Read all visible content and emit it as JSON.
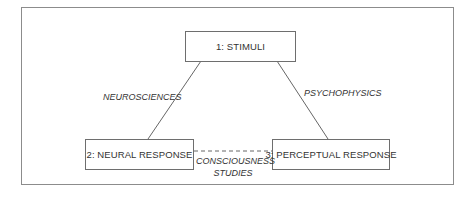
{
  "diagram": {
    "nodes": [
      {
        "id": "stimuli",
        "label": "1: STIMULI"
      },
      {
        "id": "neural",
        "label": "2: NEURAL RESPONSE"
      },
      {
        "id": "perceptual",
        "label": "3: PERCEPTUAL RESPONSE"
      }
    ],
    "edges": [
      {
        "from": "stimuli",
        "to": "neural",
        "label": "NEUROSCIENCES",
        "style": "solid"
      },
      {
        "from": "stimuli",
        "to": "perceptual",
        "label": "PSYCHOPHYSICS",
        "style": "solid"
      },
      {
        "from": "neural",
        "to": "perceptual",
        "label_line1": "CONSCIOUSNESS",
        "label_line2": "STUDIES",
        "style": "dashed"
      }
    ],
    "colors": {
      "frame_border": "#8c8c8c",
      "node_border": "#6e6e6e",
      "line": "#555555",
      "text": "#333333"
    }
  }
}
